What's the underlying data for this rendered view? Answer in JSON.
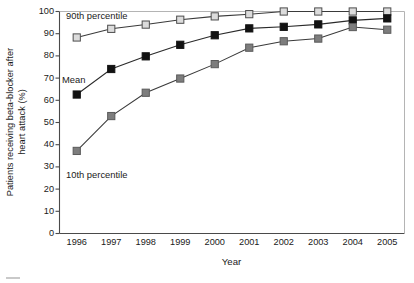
{
  "chart_data": {
    "type": "line",
    "title": "",
    "subtitle": "",
    "xlabel": "Year",
    "ylabel": "Patients receiving beta-blocker after\nheart attack (%)",
    "categories": [
      "1996",
      "1997",
      "1998",
      "1999",
      "2000",
      "2001",
      "2002",
      "2003",
      "2004",
      "2005"
    ],
    "x": [
      1996,
      1997,
      1998,
      1999,
      2000,
      2001,
      2002,
      2003,
      2004,
      2005
    ],
    "xlim": [
      1995.5,
      2005.5
    ],
    "ylim": [
      0,
      100
    ],
    "yticks": [
      0,
      10,
      20,
      30,
      40,
      50,
      60,
      70,
      80,
      90,
      100
    ],
    "ytick_labels": [
      "0",
      "10",
      "20",
      "30",
      "40",
      "50",
      "60",
      "70",
      "80",
      "90",
      "100"
    ],
    "grid": false,
    "legend_position": "inline-annotations",
    "series": [
      {
        "name": "90th percentile",
        "marker": "square",
        "marker_fill": "#dcdcdc",
        "marker_edge": "#4d4d4d",
        "line_color": "#3a3a3a",
        "values": [
          88.3,
          92.2,
          94.1,
          96.3,
          97.8,
          98.8,
          100.0,
          100.0,
          100.0,
          100.0
        ]
      },
      {
        "name": "Mean",
        "marker": "square",
        "marker_fill": "#121212",
        "marker_edge": "#121212",
        "line_color": "#2a2a2a",
        "values": [
          62.6,
          74.1,
          79.8,
          85.0,
          89.3,
          92.4,
          93.1,
          94.2,
          96.0,
          96.9
        ]
      },
      {
        "name": "10th percentile",
        "marker": "square",
        "marker_fill": "#7d7d7d",
        "marker_edge": "#5a5a5a",
        "line_color": "#3a3a3a",
        "values": [
          37.2,
          52.9,
          63.4,
          69.8,
          76.3,
          83.7,
          86.6,
          87.8,
          93.0,
          91.8
        ]
      }
    ],
    "annotations": [
      {
        "text": "90th percentile",
        "x_px": 66,
        "y_px": 11
      },
      {
        "text": "Mean",
        "x_px": 62,
        "y_px": 75
      },
      {
        "text": "10th percentile",
        "x_px": 66,
        "y_px": 170
      }
    ]
  },
  "axes": {
    "x_title": "Year",
    "y_title_line1": "Patients receiving beta-blocker after",
    "y_title_line2": "heart attack (%)"
  }
}
